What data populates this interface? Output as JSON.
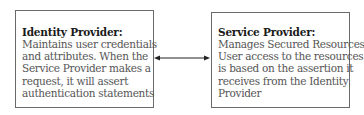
{
  "identity_provider": {
    "title": "Identity Provider:",
    "lines": [
      "Maintains user credentials",
      "and attributes. When the",
      "Service Provider makes a",
      "request, it will assert",
      "authentication statements"
    ]
  },
  "service_provider": {
    "title": "Service Provider:",
    "lines": [
      "Manages Secured Resources.",
      "User access to the resources",
      "is based on the assertion it",
      "receives from the Identity",
      "Provider"
    ]
  },
  "connector": {
    "type": "bidirectional-arrow",
    "color": "#222222"
  }
}
